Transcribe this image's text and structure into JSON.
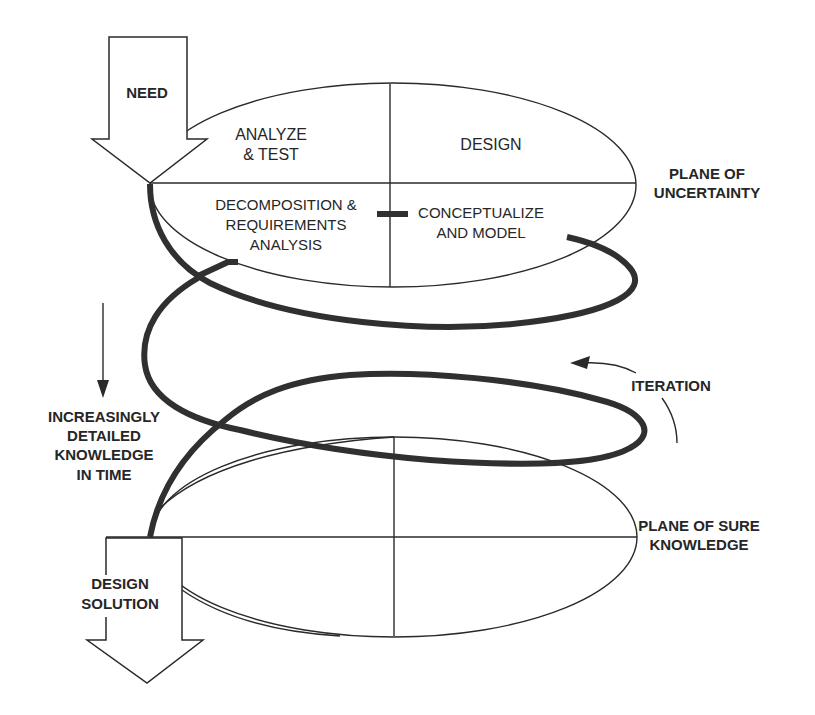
{
  "diagram": {
    "type": "spiral-design-process",
    "colors": {
      "background": "#ffffff",
      "ink": "#2a2a2a",
      "spiral": "#303030"
    },
    "input_arrow": {
      "label": "NEED"
    },
    "output_arrow": {
      "line1": "DESIGN",
      "line2": "SOLUTION"
    },
    "top_plane": {
      "label_line1": "PLANE OF",
      "label_line2": "UNCERTAINTY",
      "quadrants": {
        "upper_left": {
          "line1": "ANALYZE",
          "line2": "& TEST"
        },
        "upper_right": {
          "line1": "DESIGN"
        },
        "lower_left": {
          "line1": "DECOMPOSITION &",
          "line2": "REQUIREMENTS",
          "line3": "ANALYSIS"
        },
        "lower_right": {
          "line1": "CONCEPTUALIZE",
          "line2": "AND MODEL"
        }
      }
    },
    "bottom_plane": {
      "label_line1": "PLANE OF SURE",
      "label_line2": "KNOWLEDGE"
    },
    "time_axis": {
      "line1": "INCREASINGLY",
      "line2": "DETAILED",
      "line3": "KNOWLEDGE",
      "line4": "IN TIME"
    },
    "iteration": {
      "label": "ITERATION"
    }
  }
}
